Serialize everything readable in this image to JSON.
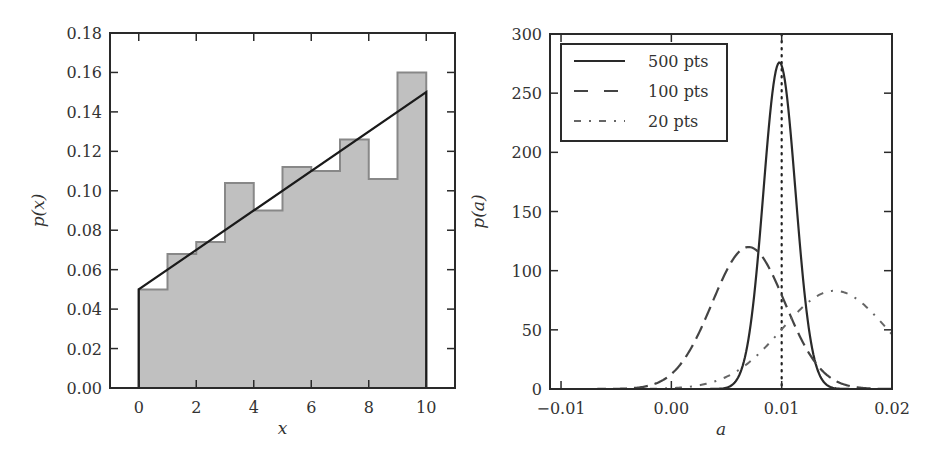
{
  "chart_data": [
    {
      "type": "bar",
      "panel": "left",
      "title": "",
      "xlabel": "x",
      "ylabel": "p(x)",
      "xlim": [
        -1,
        11
      ],
      "ylim": [
        0,
        0.18
      ],
      "xticks": [
        "0",
        "2",
        "4",
        "6",
        "8",
        "10"
      ],
      "xtick_values": [
        0,
        2,
        4,
        6,
        8,
        10
      ],
      "yticks": [
        "0.00",
        "0.02",
        "0.04",
        "0.06",
        "0.08",
        "0.10",
        "0.12",
        "0.14",
        "0.16",
        "0.18"
      ],
      "ytick_values": [
        0,
        0.02,
        0.04,
        0.06,
        0.08,
        0.1,
        0.12,
        0.14,
        0.16,
        0.18
      ],
      "histogram": {
        "bin_edges": [
          0,
          1,
          2,
          3,
          4,
          5,
          6,
          7,
          8,
          9,
          10
        ],
        "values": [
          0.05,
          0.068,
          0.074,
          0.104,
          0.09,
          0.112,
          0.11,
          0.126,
          0.106,
          0.16
        ],
        "fill_color": "#c0c0c0",
        "edge_color": "#888888"
      },
      "line": {
        "x": [
          0,
          0,
          10,
          10
        ],
        "y": [
          0,
          0.05,
          0.15,
          0
        ],
        "color": "#1a1a1a"
      },
      "grid": false
    },
    {
      "type": "line",
      "panel": "right",
      "title": "",
      "xlabel": "a",
      "ylabel": "p(a)",
      "xlim": [
        -0.011,
        0.02
      ],
      "ylim": [
        0,
        300
      ],
      "xticks": [
        "−0.01",
        "0.00",
        "0.01",
        "0.02"
      ],
      "xtick_values": [
        -0.01,
        0.0,
        0.01,
        0.02
      ],
      "yticks": [
        "0",
        "50",
        "100",
        "150",
        "200",
        "250",
        "300"
      ],
      "ytick_values": [
        0,
        50,
        100,
        150,
        200,
        250,
        300
      ],
      "vline": {
        "x": 0.01,
        "style": "dotted"
      },
      "legend": {
        "position": "upper left",
        "entries": [
          {
            "label": "500 pts",
            "style": "solid"
          },
          {
            "label": "100 pts",
            "style": "dashed"
          },
          {
            "label": "20 pts",
            "style": "dashdot"
          }
        ]
      },
      "series": [
        {
          "name": "500 pts",
          "style": "solid",
          "peak_x": 0.0098,
          "peak_y": 276,
          "sigma": 0.00145
        },
        {
          "name": "100 pts",
          "style": "dashed",
          "peak_x": 0.007,
          "peak_y": 120,
          "sigma": 0.0033
        },
        {
          "name": "20 pts",
          "style": "dashdot",
          "peak_x": 0.0148,
          "peak_y": 83,
          "sigma": 0.0048
        }
      ],
      "grid": false
    }
  ]
}
